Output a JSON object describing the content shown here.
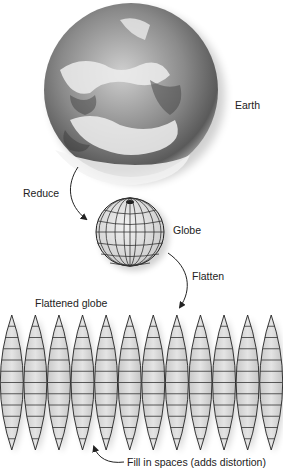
{
  "labels": {
    "earth": "Earth",
    "reduce": "Reduce",
    "globe": "Globe",
    "flatten": "Flatten",
    "flattened_globe": "Flattened globe",
    "fill_in": "Fill in spaces (adds distortion)"
  },
  "stages": [
    "Earth",
    "Globe",
    "Flattened globe"
  ],
  "gores": {
    "count": 12,
    "parallels_per_gore": 11
  },
  "colors": {
    "ink": "#222222",
    "gore_fill": "#d8d8d8",
    "background": "#ffffff"
  }
}
